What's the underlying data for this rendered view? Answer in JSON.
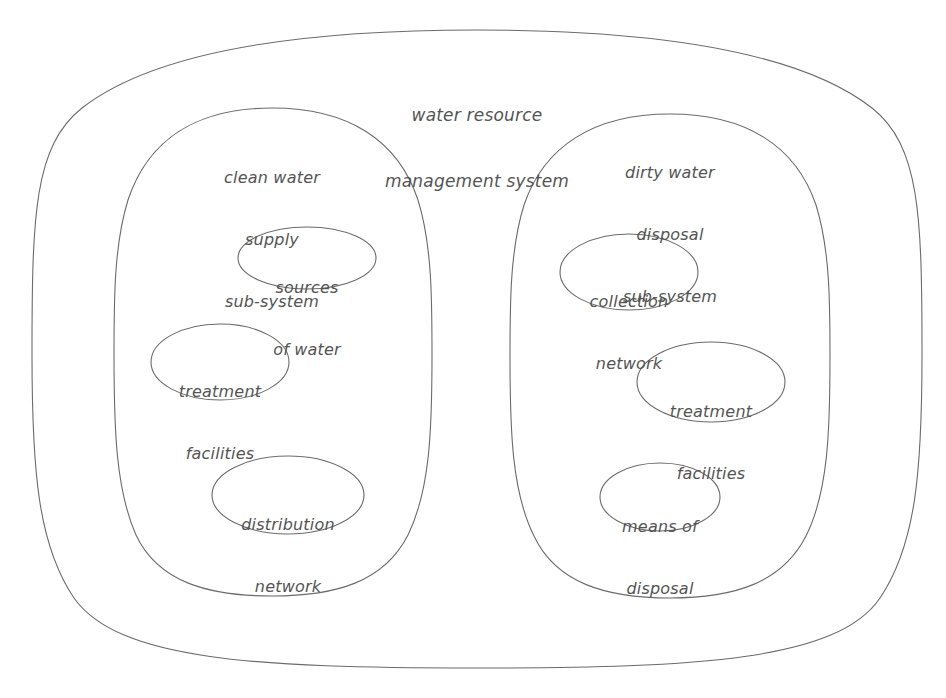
{
  "diagram": {
    "kind": "nested-set-diagram",
    "stroke_color": "#6b6b6b",
    "text_color": "#545454",
    "background_color": "#ffffff",
    "system": {
      "name": "water-resource-management-system",
      "label_lines": [
        "water resource",
        "management system"
      ]
    },
    "subsystems": [
      {
        "name": "clean-water-supply-sub-system",
        "label_lines": [
          "clean water",
          "supply",
          "sub-system"
        ],
        "components": [
          {
            "name": "sources-of-water",
            "label_lines": [
              "sources",
              "of water"
            ]
          },
          {
            "name": "treatment-facilities-clean",
            "label_lines": [
              "treatment",
              "facilities"
            ]
          },
          {
            "name": "distribution-network",
            "label_lines": [
              "distribution",
              "network"
            ]
          }
        ]
      },
      {
        "name": "dirty-water-disposal-sub-system",
        "label_lines": [
          "dirty water",
          "disposal",
          "sub-system"
        ],
        "components": [
          {
            "name": "collection-network",
            "label_lines": [
              "collection",
              "network"
            ]
          },
          {
            "name": "treatment-facilities-dirty",
            "label_lines": [
              "treatment",
              "facilities"
            ]
          },
          {
            "name": "means-of-disposal",
            "label_lines": [
              "means of",
              "disposal"
            ]
          }
        ]
      }
    ]
  },
  "labels": {
    "system_line1": "water resource",
    "system_line2": "management system",
    "clean_line1": "clean water",
    "clean_line2": "supply",
    "clean_line3": "sub-system",
    "dirty_line1": "dirty water",
    "dirty_line2": "disposal",
    "dirty_line3": "sub-system",
    "sources_line1": "sources",
    "sources_line2": "of water",
    "treat_left_line1": "treatment",
    "treat_left_line2": "facilities",
    "distribution_line1": "distribution",
    "distribution_line2": "network",
    "collection_line1": "collection",
    "collection_line2": "network",
    "treat_right_line1": "treatment",
    "treat_right_line2": "facilities",
    "disposal_line1": "means of",
    "disposal_line2": "disposal"
  }
}
